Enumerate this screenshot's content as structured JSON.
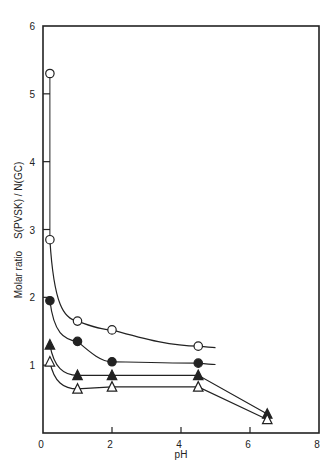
{
  "chart_data": {
    "type": "line",
    "title": "",
    "xlabel": "pH",
    "ylabel": "Molar ratio   S(PVSK) / N(GC)",
    "xlim": [
      0,
      8
    ],
    "ylim": [
      0,
      6
    ],
    "xticks": [
      0,
      2,
      4,
      6,
      8
    ],
    "yticks": [
      1,
      2,
      3,
      4,
      5,
      6
    ],
    "grid": false,
    "legend": "none",
    "series": [
      {
        "name": "open-circle",
        "marker": "circle-open",
        "x": [
          0.2,
          0.2,
          1,
          2,
          4.5
        ],
        "y": [
          5.3,
          2.85,
          1.65,
          1.52,
          1.28
        ],
        "curve_end_x": 5.0
      },
      {
        "name": "filled-circle",
        "marker": "circle-filled",
        "x": [
          0.2,
          1,
          2,
          4.5
        ],
        "y": [
          1.95,
          1.35,
          1.05,
          1.03
        ],
        "curve_end_x": 5.0
      },
      {
        "name": "filled-triangle",
        "marker": "triangle-filled",
        "x": [
          0.2,
          1,
          2,
          4.5,
          6.5
        ],
        "y": [
          1.3,
          0.85,
          0.85,
          0.85,
          0.28
        ]
      },
      {
        "name": "open-triangle",
        "marker": "triangle-open",
        "x": [
          0.2,
          1,
          2,
          4.5,
          6.5
        ],
        "y": [
          1.05,
          0.65,
          0.68,
          0.68,
          0.2
        ]
      }
    ]
  },
  "labels": {
    "xlabel": "pH",
    "ylabel_left": "Molar ratio",
    "ylabel_right": "S(PVSK) / N(GC)"
  }
}
